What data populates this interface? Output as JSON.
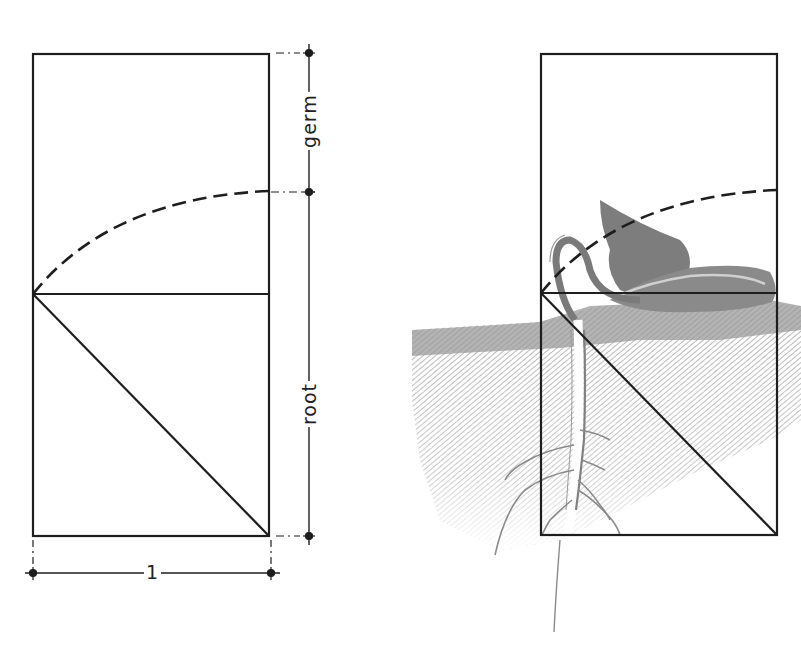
{
  "figure": {
    "colors": {
      "line": "#1e1e1e",
      "soil": "#8a8a8a",
      "seedling": "#7a7a7a",
      "background": "#ffffff"
    }
  },
  "left_diagram": {
    "labels": {
      "germ": "germ",
      "root": "root",
      "unit": "1"
    },
    "rectangle": {
      "x": 33,
      "y": 54,
      "width": 236,
      "height": 482
    },
    "square_divider_y": 294,
    "arc_end_y": 191,
    "dimension_line_x": 309
  },
  "right_diagram": {
    "rectangle": {
      "x": 541,
      "y": 54,
      "width": 236,
      "height": 481
    },
    "square_divider_y": 293,
    "arc_end_y": 190,
    "illustration": "germinating bean seedling with roots in soil"
  }
}
